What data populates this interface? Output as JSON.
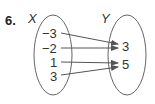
{
  "problem_number": "6.",
  "domain_set": {
    "label": "X",
    "elements": [
      "−3",
      "−2",
      "1",
      "3"
    ]
  },
  "range_set": {
    "label": "Y",
    "elements": [
      "3",
      "5"
    ]
  },
  "mapping": [
    {
      "from": "−3",
      "to": "3"
    },
    {
      "from": "−2",
      "to": "3"
    },
    {
      "from": "1",
      "to": "5"
    },
    {
      "from": "3",
      "to": "5"
    }
  ],
  "colors": {
    "stroke": "#555555",
    "text": "#333333"
  }
}
